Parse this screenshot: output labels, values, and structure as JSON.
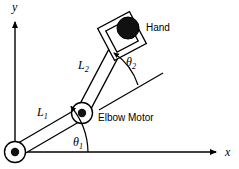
{
  "figure": {
    "kind": "two-link-robot-arm-diagram",
    "background_color": "#ffffff",
    "stroke_color": "#000000",
    "axes": {
      "x_label": "x",
      "y_label": "y",
      "origin_label": ""
    },
    "links": [
      {
        "id": "link1",
        "label": "L",
        "subscript": "1"
      },
      {
        "id": "link2",
        "label": "L",
        "subscript": "2"
      }
    ],
    "angles": [
      {
        "id": "theta1",
        "label": "θ",
        "subscript": "1"
      },
      {
        "id": "theta2",
        "label": "θ",
        "subscript": "2"
      }
    ],
    "callouts": {
      "hand": "Hand",
      "elbow_motor": "Elbow Motor"
    },
    "joints": [
      {
        "id": "base-joint",
        "name": "shoulder-joint"
      },
      {
        "id": "elbow-joint",
        "name": "elbow-joint"
      },
      {
        "id": "hand-payload",
        "name": "hand-payload"
      }
    ]
  }
}
